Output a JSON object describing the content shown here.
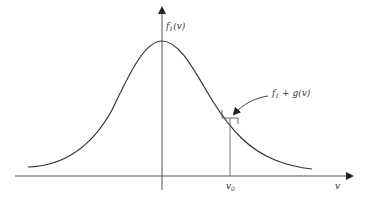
{
  "diagram": {
    "type": "gaussian-distribution-curve",
    "y_axis_label": {
      "main": "f",
      "sub": "1",
      "arg": "(v)"
    },
    "x_axis_label": "v",
    "marker_label": {
      "main": "v",
      "sub": "0"
    },
    "annotation": {
      "main": "f",
      "sub": "1",
      "rest": " + g(v)"
    },
    "colors": {
      "line": "#333333",
      "background": "#ffffff"
    }
  }
}
